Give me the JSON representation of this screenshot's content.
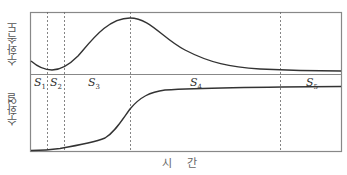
{
  "title": "",
  "axes": {
    "x_label": "시 간",
    "y_label_top": "수화속도",
    "y_label_bottom": "수화열"
  },
  "stages": [
    {
      "name": "S",
      "sub": "1"
    },
    {
      "name": "S",
      "sub": "2"
    },
    {
      "name": "S",
      "sub": "3"
    },
    {
      "name": "S",
      "sub": "4"
    },
    {
      "name": "S",
      "sub": "5"
    }
  ],
  "colors": {
    "frame": "#888888",
    "curve": "#333333",
    "dashed": "#666666",
    "background": "#ffffff"
  },
  "panels": [
    {
      "name": "hydration-rate",
      "label": "수화속도",
      "description": "rate curve: small initial dip, peak at S3/S4 boundary, decays to plateau"
    },
    {
      "name": "hydration-heat",
      "label": "수화열",
      "description": "cumulative heat: S-shaped rise saturating in S4/S5"
    }
  ]
}
